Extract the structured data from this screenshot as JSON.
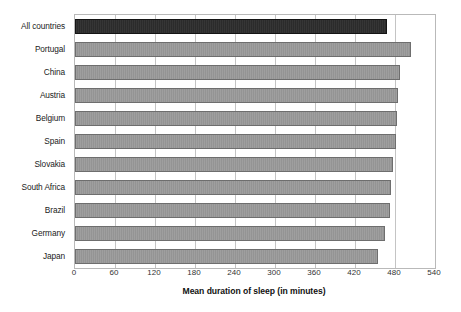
{
  "chart_data": {
    "type": "bar",
    "orientation": "horizontal",
    "title": "",
    "xlabel": "Mean duration of sleep (in minutes)",
    "ylabel": "",
    "xlim": [
      0,
      540
    ],
    "xticks": [
      0,
      60,
      120,
      180,
      240,
      300,
      360,
      420,
      480,
      540
    ],
    "xtick_labels": [
      "0",
      "60",
      "120",
      "180",
      "240",
      "300",
      "360",
      "420",
      "480",
      "540"
    ],
    "grid": "vertical",
    "legend": "none",
    "categories": [
      "All countries",
      "Portugal",
      "China",
      "Austria",
      "Belgium",
      "Spain",
      "Slovakia",
      "South Africa",
      "Brazil",
      "Germany",
      "Japan"
    ],
    "values": [
      468,
      504,
      487,
      485,
      483,
      482,
      477,
      474,
      473,
      465,
      454
    ],
    "highlight_index": 0,
    "colors": {
      "bar": "#949494",
      "bar_border": "#6e6e6e",
      "highlight_bar": "#2b2b2b",
      "highlight_border": "#141414",
      "gridline": "#c4c4c4",
      "frame": "#b9b9b9",
      "background": "#ffffff",
      "text": "#222222"
    }
  }
}
